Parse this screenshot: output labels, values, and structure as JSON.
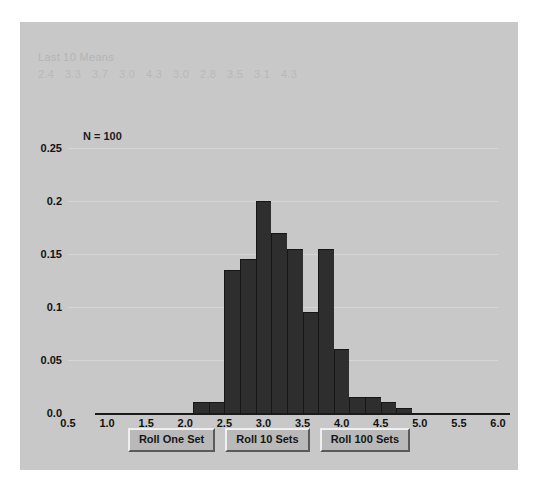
{
  "panel": {
    "background_color": "#c8c8c8",
    "means_title": "Last 10 Means",
    "means_values": [
      "2.4",
      "3.3",
      "3.7",
      "3.0",
      "4.3",
      "3.0",
      "2.8",
      "3.5",
      "3.1",
      "4.3"
    ],
    "n_label": "N = 100"
  },
  "buttons": {
    "roll_one": "Roll One Set",
    "roll_ten": "Roll 10 Sets",
    "roll_hundred": "Roll 100 Sets"
  },
  "chart_data": {
    "type": "bar",
    "title": "",
    "xlabel": "",
    "ylabel": "",
    "xlim": [
      0.5,
      6.0
    ],
    "ylim": [
      0.0,
      0.27
    ],
    "grid": true,
    "legend": "none",
    "bar_color": "#2e2e2e",
    "bin_width": 0.2,
    "xticks": [
      "0.5",
      "1.0",
      "1.5",
      "2.0",
      "2.5",
      "3.0",
      "3.5",
      "4.0",
      "4.5",
      "5.0",
      "5.5",
      "6.0"
    ],
    "xtick_values": [
      0.5,
      1.0,
      1.5,
      2.0,
      2.5,
      3.0,
      3.5,
      4.0,
      4.5,
      5.0,
      5.5,
      6.0
    ],
    "yticks": [
      "0.0",
      "0.05",
      "0.1",
      "0.15",
      "0.2",
      "0.25"
    ],
    "ytick_values": [
      0.0,
      0.05,
      0.1,
      0.15,
      0.2,
      0.25
    ],
    "bin_starts": [
      2.1,
      2.3,
      2.5,
      2.7,
      2.9,
      3.1,
      3.3,
      3.5,
      3.7,
      3.9,
      4.1,
      4.3,
      4.5,
      4.7
    ],
    "values": [
      0.01,
      0.01,
      0.135,
      0.145,
      0.2,
      0.17,
      0.155,
      0.095,
      0.155,
      0.06,
      0.015,
      0.015,
      0.01,
      0.005
    ],
    "categories": [
      "2.1",
      "2.3",
      "2.5",
      "2.7",
      "2.9",
      "3.1",
      "3.3",
      "3.5",
      "3.7",
      "3.9",
      "4.1",
      "4.3",
      "4.5",
      "4.7"
    ]
  }
}
